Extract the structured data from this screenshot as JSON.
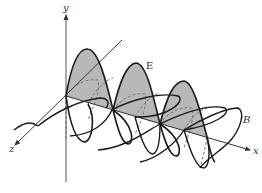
{
  "diagram": {
    "title": "",
    "type": "electromagnetic-wave",
    "labels": {
      "y_axis": "y",
      "x_axis": "x",
      "z_axis": "z",
      "electric_field": "E",
      "magnetic_field": "B"
    },
    "colors": {
      "line": "#1a1a1a",
      "axis": "#555555",
      "shade": "#b8b8b8",
      "dashed": "#777777",
      "background": "#ffffff"
    }
  }
}
